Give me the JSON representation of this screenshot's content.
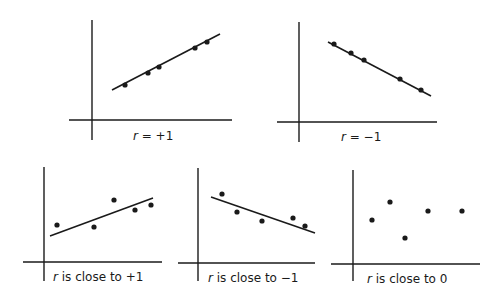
{
  "panels": [
    {
      "id": "perfect-positive",
      "label_var": "r",
      "label_rest": " = +1",
      "has_fit_line": true,
      "axes": {
        "vx": 92,
        "vy1": 20,
        "vy2": 140,
        "hy": 120,
        "hx1": 69,
        "hx2": 232
      },
      "line": [
        112,
        90,
        220,
        34
      ],
      "points": [
        [
          125,
          85
        ],
        [
          148,
          73
        ],
        [
          159,
          67
        ],
        [
          195,
          48
        ],
        [
          207,
          42
        ]
      ],
      "label_pos": [
        133,
        129
      ]
    },
    {
      "id": "perfect-negative",
      "label_var": "r",
      "label_rest": " = −1",
      "has_fit_line": true,
      "axes": {
        "vx": 299,
        "vy1": 22,
        "vy2": 142,
        "hy": 122,
        "hx1": 277,
        "hx2": 437
      },
      "line": [
        328,
        42,
        431,
        96
      ],
      "points": [
        [
          334,
          44
        ],
        [
          351,
          53
        ],
        [
          364,
          60
        ],
        [
          400,
          79
        ],
        [
          421,
          90
        ]
      ],
      "label_pos": [
        341,
        130
      ]
    },
    {
      "id": "close-to-positive-one",
      "label_var": "r",
      "label_rest": " is close to +1",
      "has_fit_line": true,
      "axes": {
        "vx": 44,
        "vy1": 167,
        "vy2": 281,
        "hy": 262,
        "hx1": 23,
        "hx2": 162
      },
      "line": [
        50,
        236,
        153,
        198
      ],
      "points": [
        [
          57,
          225
        ],
        [
          94,
          227
        ],
        [
          114,
          200
        ],
        [
          135,
          210
        ],
        [
          151,
          205
        ]
      ],
      "label_pos": [
        53,
        270
      ]
    },
    {
      "id": "close-to-negative-one",
      "label_var": "r",
      "label_rest": " is close to −1",
      "has_fit_line": true,
      "axes": {
        "vx": 198,
        "vy1": 168,
        "vy2": 281,
        "hy": 263,
        "hx1": 178,
        "hx2": 315
      },
      "line": [
        211,
        197,
        315,
        233
      ],
      "points": [
        [
          222,
          194
        ],
        [
          237,
          212
        ],
        [
          262,
          221
        ],
        [
          293,
          218
        ],
        [
          305,
          226
        ]
      ],
      "label_pos": [
        208,
        271
      ]
    },
    {
      "id": "close-to-zero",
      "label_var": "r",
      "label_rest": " is close to 0",
      "has_fit_line": false,
      "axes": {
        "vx": 353,
        "vy1": 170,
        "vy2": 281,
        "hy": 264,
        "hx1": 331,
        "hx2": 480
      },
      "line": null,
      "points": [
        [
          372,
          220
        ],
        [
          390,
          202
        ],
        [
          405,
          238
        ],
        [
          428,
          211
        ],
        [
          462,
          211
        ]
      ],
      "label_pos": [
        367,
        272
      ]
    }
  ]
}
